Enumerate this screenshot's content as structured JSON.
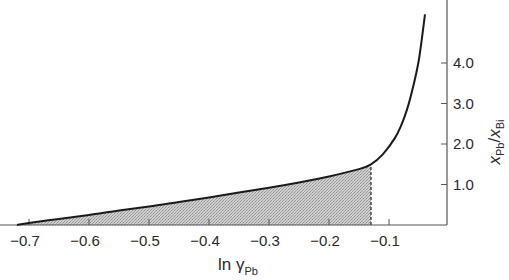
{
  "chart_data": {
    "type": "area",
    "title": "",
    "xlabel": "ln γ_Pb",
    "xlabel_main": "ln γ",
    "xlabel_sub": "Pb",
    "ylabel": "x_Pb / x_Bi",
    "ylabel_parts": {
      "x1": "x",
      "sub1": "Pb",
      "slash": "/",
      "x2": "x",
      "sub2": "Bi"
    },
    "y_axis_position": "right",
    "xlim": [
      -0.73,
      -0.03
    ],
    "ylim": [
      0,
      5.5
    ],
    "x_ticks": [
      -0.7,
      -0.6,
      -0.5,
      -0.4,
      -0.3,
      -0.2,
      -0.1
    ],
    "x_tick_labels": [
      "−0.7",
      "−0.6",
      "−0.5",
      "−0.4",
      "−0.3",
      "−0.2",
      "−0.1"
    ],
    "y_ticks": [
      1.0,
      2.0,
      3.0,
      4.0
    ],
    "y_tick_labels": [
      "1.0",
      "2.0",
      "3.0",
      "4.0"
    ],
    "grid": false,
    "legend": null,
    "series": [
      {
        "name": "x_Pb/x_Bi vs ln γ_Pb",
        "x": [
          -0.72,
          -0.7,
          -0.65,
          -0.6,
          -0.55,
          -0.5,
          -0.45,
          -0.4,
          -0.35,
          -0.3,
          -0.25,
          -0.2,
          -0.15,
          -0.13,
          -0.11,
          -0.09,
          -0.08,
          -0.07,
          -0.06,
          -0.05,
          -0.04
        ],
        "y": [
          0.0,
          0.05,
          0.15,
          0.25,
          0.36,
          0.46,
          0.57,
          0.68,
          0.8,
          0.92,
          1.05,
          1.2,
          1.38,
          1.5,
          1.75,
          2.15,
          2.45,
          2.85,
          3.4,
          4.1,
          5.2
        ]
      }
    ],
    "annotations": [
      {
        "type": "shaded_area",
        "description": "Area under curve shaded from x=-0.72 to x=-0.13",
        "x_from": -0.72,
        "x_to": -0.13
      },
      {
        "type": "dashed_vertical_line",
        "x": -0.13,
        "y_from": 0,
        "y_to": 1.5
      }
    ]
  },
  "colors": {
    "curve": "#1a1a1a",
    "axis": "#555555",
    "shade": "#b9b9b9",
    "text": "#2a2a2a"
  }
}
